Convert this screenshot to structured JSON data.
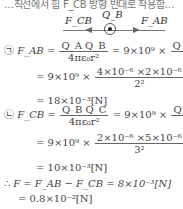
{
  "cut_line": "…직선에서 힘 F_CB 방향 반대로 작용함…",
  "diagram": {
    "charge_label": "Q_B",
    "left_force": "F_CB",
    "right_force": "F_AB"
  },
  "step_a": {
    "marker": "㉠",
    "lhs": "F_AB =",
    "frac1_num": "Q_A Q_B",
    "frac1_den": "4πε₀r²",
    "eq_mid": "= 9×10⁹ ×",
    "frac2_num": "Q_A Q_B",
    "frac2_den": "r²",
    "line2_prefix": "= 9×10⁹ ×",
    "line2_num": "4×10⁻⁶ ×2×10⁻⁶",
    "line2_den": "2²",
    "result": "= 18×10⁻³[N]"
  },
  "step_b": {
    "marker": "㉡",
    "lhs": "F_CB =",
    "frac1_num": "Q_B Q_C",
    "frac1_den": "4πε₀r²",
    "eq_mid": "= 9×10⁹ ×",
    "frac2_num": "Q_B Q_C",
    "frac2_den": "r²",
    "line2_prefix": "= 9×10⁹ ×",
    "line2_num": "2×10⁻⁶ ×5×10⁻⁶",
    "line2_den": "3²",
    "result": "= 10×10⁻³[N]"
  },
  "conclusion": {
    "marker": "∴",
    "line1": "F = F_AB − F_CB = 8×10⁻³[N]",
    "line2": "= 0.8×10⁻²[N]"
  }
}
